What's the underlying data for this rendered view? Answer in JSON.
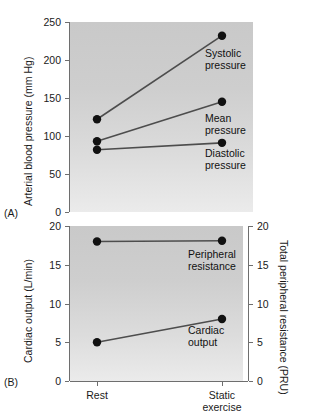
{
  "figure": {
    "panel_a_letter": "(A)",
    "panel_b_letter": "(B)"
  },
  "chart_data": [
    {
      "type": "line",
      "panel": "A",
      "title": "",
      "xlabel": "",
      "ylabel": "Arterial blood pressure (mm Hg)",
      "categories": [
        "Rest",
        "Static exercise"
      ],
      "ylim": [
        0,
        250
      ],
      "yticks": [
        0,
        50,
        100,
        150,
        200,
        250
      ],
      "ytick_labels": [
        "0",
        "50",
        "100",
        "150",
        "200",
        "250"
      ],
      "grid": false,
      "legend": "inline-annotations",
      "series": [
        {
          "name": "Systolic pressure",
          "values": [
            122,
            232
          ],
          "annotation": "Systolic\npressure"
        },
        {
          "name": "Mean pressure",
          "values": [
            93,
            145
          ],
          "annotation": "Mean\npressure"
        },
        {
          "name": "Diastolic pressure",
          "values": [
            82,
            91
          ],
          "annotation": "Diastolic\npressure"
        }
      ]
    },
    {
      "type": "line",
      "panel": "B",
      "title": "",
      "xlabel": "",
      "ylabel": "Cardiac output (L/min)",
      "ylabel_right": "Total peripheral resistance (PRU)",
      "categories": [
        "Rest",
        "Static exercise"
      ],
      "ylim": [
        0,
        20
      ],
      "yticks": [
        0,
        5,
        10,
        15,
        20
      ],
      "ytick_labels": [
        "0",
        "5",
        "10",
        "15",
        "20"
      ],
      "ylim_right": [
        0,
        20
      ],
      "yticks_right": [
        0,
        5,
        10,
        15,
        20
      ],
      "ytick_labels_right": [
        "0",
        "5",
        "10",
        "15",
        "20"
      ],
      "grid": false,
      "legend": "inline-annotations",
      "series": [
        {
          "name": "Peripheral resistance",
          "axis": "right",
          "values": [
            18.0,
            18.1
          ],
          "annotation": "Peripheral\nresistance"
        },
        {
          "name": "Cardiac output",
          "axis": "left",
          "values": [
            5.0,
            8.0
          ],
          "annotation": "Cardiac\noutput"
        }
      ]
    }
  ],
  "axes": {
    "panel_a": {
      "y_title": "Arterial blood pressure (mm Hg)",
      "tick_labels": [
        "250",
        "200",
        "150",
        "100",
        "50",
        "0"
      ]
    },
    "panel_b": {
      "y_title_left": "Cardiac output (L/min)",
      "y_title_right": "Total peripheral resistance (PRU)",
      "tick_labels_left": [
        "20",
        "15",
        "10",
        "5",
        "0"
      ],
      "tick_labels_right": [
        "20",
        "15",
        "10",
        "5",
        "0"
      ]
    },
    "x_categories": [
      "Rest",
      "Static\nexercise"
    ]
  },
  "annotations": {
    "systolic": "Systolic\npressure",
    "mean": "Mean\npressure",
    "diastolic": "Diastolic\npressure",
    "peripheral": "Peripheral\nresistance",
    "cardiac": "Cardiac\noutput"
  },
  "colors": {
    "marker": "#111111",
    "line": "#4d4d4d",
    "axis": "#6e6e6e",
    "plot_bg_top": "#c9c9c9",
    "plot_bg_bottom": "#ebebeb",
    "text": "#1a1a1a"
  }
}
